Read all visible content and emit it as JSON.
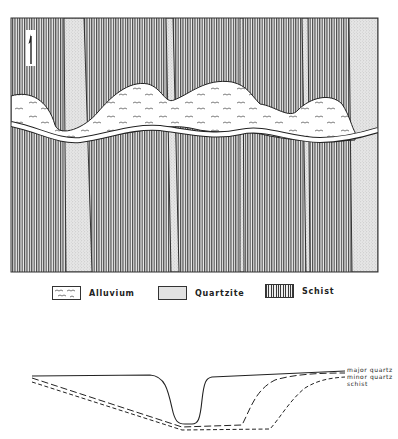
{
  "map": {
    "north_arrow": "north-arrow",
    "units": [
      "Alluvium",
      "Quartzite",
      "Schist"
    ]
  },
  "legend": {
    "items": [
      {
        "label": "Alluvium",
        "pattern": "alluvium-pattern"
      },
      {
        "label": "Quartzite",
        "pattern": "quartzite-stipple"
      },
      {
        "label": "Schist",
        "pattern": "schist-vertical-hatch"
      }
    ]
  },
  "profile": {
    "labels": {
      "major": "major quartz",
      "minor": "minor quartz",
      "schist": "schist"
    }
  },
  "colors": {
    "line": "#222222",
    "schist_fill": "#9a9a9a",
    "quartzite_fill": "#dcdcdc",
    "alluvium_fill": "#ffffff"
  }
}
